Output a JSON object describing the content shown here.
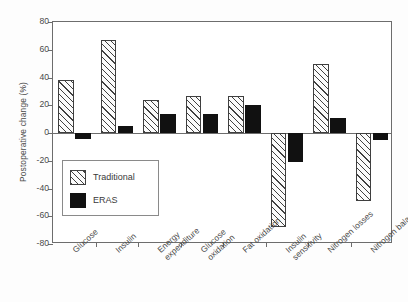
{
  "chart_data": {
    "type": "bar",
    "title": "",
    "xlabel": "",
    "ylabel": "Postoperative change (%)",
    "ylim": [
      -80,
      80
    ],
    "ytick_labels": [
      "80",
      "60",
      "40",
      "20",
      "0",
      "-20",
      "-40",
      "-60",
      "-80"
    ],
    "ytick_values": [
      80,
      60,
      40,
      20,
      0,
      -20,
      -40,
      -60,
      -80
    ],
    "grid": false,
    "legend_position": "inside-lower-left",
    "categories": [
      "Glucose",
      "Insulin",
      "Energy\nexpenditure",
      "Glucose\noxidation",
      "Fat oxidation",
      "Insulin\nsensitivity",
      "Nitrogen losses",
      "Nitrogen balance"
    ],
    "category_lines": [
      [
        "Glucose"
      ],
      [
        "Insulin"
      ],
      [
        "Energy",
        "expenditure"
      ],
      [
        "Glucose",
        "oxidation"
      ],
      [
        "Fat oxidation"
      ],
      [
        "Insulin",
        "sensitivity"
      ],
      [
        "Nitrogen losses"
      ],
      [
        "Nitrogen balance"
      ]
    ],
    "series": [
      {
        "name": "Traditional",
        "fill": "hatched",
        "color": "#fbfbfb",
        "values": [
          38,
          67,
          24,
          27,
          27,
          -68,
          50,
          -49
        ]
      },
      {
        "name": "ERAS",
        "fill": "solid",
        "color": "#111111",
        "values": [
          -4,
          5,
          14,
          14,
          20,
          -21,
          11,
          -5
        ]
      }
    ]
  },
  "legend": {
    "items": [
      {
        "label": "Traditional",
        "style": "hatched"
      },
      {
        "label": "ERAS",
        "style": "solid"
      }
    ]
  },
  "axis": {
    "y_title": "Postoperative change (%)"
  }
}
